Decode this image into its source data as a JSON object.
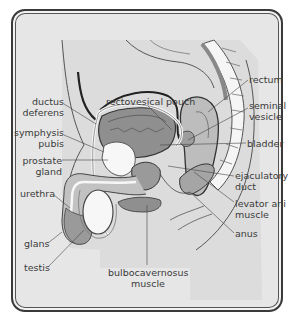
{
  "diagram": {
    "type": "anatomical-illustration",
    "colors": {
      "background": "#e6e6e6",
      "frame": "#3a3a3a",
      "tissue_dark": "#8d8d8d",
      "tissue_mid": "#b3b3b3",
      "tissue_light": "#cfcfcf",
      "white": "#f7f7f7",
      "line": "#444444",
      "text": "#3b3b3b"
    },
    "labels": {
      "ductus_deferens": [
        "ductus",
        "deferens"
      ],
      "symphysis_pubis": [
        "symphysis",
        "pubis"
      ],
      "prostate_gland": [
        "prostate",
        "gland"
      ],
      "urethra": "urethra",
      "glans": "glans",
      "testis": "testis",
      "rectovesical_pouch": "rectovesical pouch",
      "rectum": "rectum",
      "seminal_vesicle": [
        "seminal",
        "vesicle"
      ],
      "bladder": "bladder",
      "ejaculatory_duct": [
        "ejaculatory",
        "duct"
      ],
      "levator_ani_muscle": [
        "levator ani",
        "muscle"
      ],
      "anus": "anus",
      "bulbocavernosus_muscle": [
        "bulbocavernosus",
        "muscle"
      ]
    }
  }
}
